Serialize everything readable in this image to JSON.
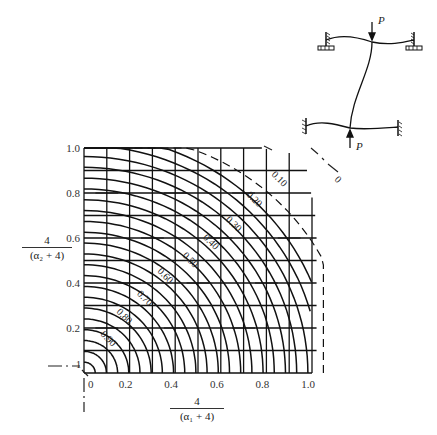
{
  "chart_data": {
    "type": "line",
    "title": "",
    "xlabel": "4/(α1+4)",
    "ylabel": "4/(α2+4)",
    "xlim": [
      0,
      1.0
    ],
    "ylim": [
      0,
      1.0
    ],
    "x_ticks": [
      "0",
      "0.2",
      "0.4",
      "0.6",
      "0.8",
      "1.0"
    ],
    "y_ticks": [
      "0.2",
      "0.4",
      "0.6",
      "0.8",
      "1.0"
    ],
    "grid": true,
    "contour_labels": [
      "0.90",
      "0.80",
      "0.70",
      "0.60",
      "0.50",
      "0.40",
      "0.30",
      "0.20",
      "0.10",
      "0"
    ],
    "contour_values": [
      0.9,
      0.8,
      0.7,
      0.6,
      0.5,
      0.4,
      0.3,
      0.2,
      0.1,
      0
    ],
    "corner_labels": {
      "bottom_left": "1",
      "top_right": "0"
    }
  },
  "axes": {
    "x_label_num": "4",
    "x_label_den": "(α₁ + 4)",
    "y_label_num": "4",
    "y_label_den": "(α₂ + 4)"
  },
  "frame_diagram": {
    "load_top": "P",
    "load_bottom": "P"
  }
}
